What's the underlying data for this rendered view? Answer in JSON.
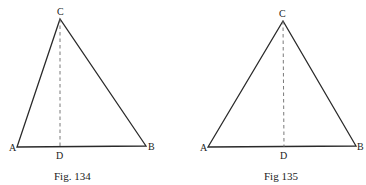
{
  "figures": [
    {
      "caption": "Fig. 134",
      "vertices": {
        "A": {
          "label": "A",
          "x": 17,
          "y": 147
        },
        "B": {
          "label": "B",
          "x": 146,
          "y": 146
        },
        "C": {
          "label": "C",
          "x": 60,
          "y": 19
        },
        "D": {
          "label": "D",
          "x": 60,
          "y": 147
        }
      },
      "segments": [
        {
          "from": "A",
          "to": "B",
          "style": "solid"
        },
        {
          "from": "B",
          "to": "C",
          "style": "solid"
        },
        {
          "from": "C",
          "to": "A",
          "style": "solid"
        },
        {
          "from": "C",
          "to": "D",
          "style": "dashed",
          "role": "altitude"
        }
      ]
    },
    {
      "caption": "Fig 135",
      "vertices": {
        "A": {
          "label": "A",
          "x": 208,
          "y": 147
        },
        "B": {
          "label": "B",
          "x": 356,
          "y": 146
        },
        "C": {
          "label": "C",
          "x": 283,
          "y": 21
        },
        "D": {
          "label": "D",
          "x": 284,
          "y": 147
        }
      },
      "segments": [
        {
          "from": "A",
          "to": "B",
          "style": "solid"
        },
        {
          "from": "B",
          "to": "C",
          "style": "solid"
        },
        {
          "from": "C",
          "to": "A",
          "style": "solid"
        },
        {
          "from": "C",
          "to": "D",
          "style": "dashed",
          "role": "altitude"
        }
      ]
    }
  ]
}
